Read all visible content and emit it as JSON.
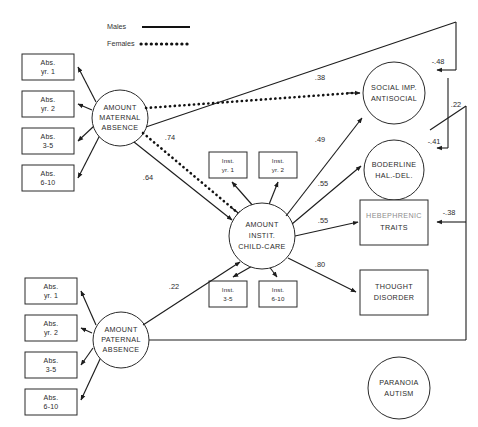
{
  "figure": {
    "type": "path-diagram"
  },
  "legend": {
    "males_label": "Males",
    "males_style": "solid-line",
    "females_label": "Females",
    "females_style": "dotted-line"
  },
  "latent_variables": {
    "maternal": "AMOUNT\nMATERNAL\nABSENCE",
    "maternal_lines": [
      "AMOUNT",
      "MATERNAL",
      "ABSENCE"
    ],
    "paternal_lines": [
      "AMOUNT",
      "PATERNAL",
      "ABSENCE"
    ],
    "institutional_lines": [
      "AMOUNT",
      "INSTIT.",
      "CHILD-CARE"
    ],
    "social_lines": [
      "SOCIAL IMP.",
      "ANTISOCIAL"
    ],
    "borderline_lines": [
      "BODERLINE",
      "HAL.-DEL."
    ],
    "paranoia_lines": [
      "PARANOIA",
      "AUTISM"
    ]
  },
  "observed_variables": {
    "hebephrenic_lines": [
      "HEBEPHRENIC",
      "TRAITS"
    ],
    "thought_lines": [
      "THOUGHT",
      "DISORDER"
    ]
  },
  "maternal_indicators": [
    {
      "line1": "Abs.",
      "line2": "yr. 1"
    },
    {
      "line1": "Abs.",
      "line2": "yr. 2"
    },
    {
      "line1": "Abs.",
      "line2": "3-5"
    },
    {
      "line1": "Abs.",
      "line2": "6-10"
    }
  ],
  "paternal_indicators": [
    {
      "line1": "Abs.",
      "line2": "yr. 1"
    },
    {
      "line1": "Abs.",
      "line2": "yr. 2"
    },
    {
      "line1": "Abs.",
      "line2": "3-5"
    },
    {
      "line1": "Abs.",
      "line2": "6-10"
    }
  ],
  "institution_indicators_top": [
    {
      "line1": "Inst.",
      "line2": "yr. 1"
    },
    {
      "line1": "Inst.",
      "line2": "yr. 2"
    }
  ],
  "institution_indicators_bottom": [
    {
      "line1": "Inst.",
      "line2": "3-5"
    },
    {
      "line1": "Inst.",
      "line2": "6-10"
    }
  ],
  "coefficients": {
    "maternal_to_instit_female": ".74",
    "maternal_to_instit_male": ".64",
    "maternal_to_social_female": ".38",
    "instit_to_social": ".49",
    "instit_to_borderline": ".55",
    "instit_to_hebephrenic": ".55",
    "instit_to_thought": ".80",
    "paternal_to_instit": ".22",
    "feedback_social": "-.48",
    "feedback_borderline": "-.41",
    "feedback_hebephrenic": "-.38",
    "feedback_paternal": ".22"
  }
}
